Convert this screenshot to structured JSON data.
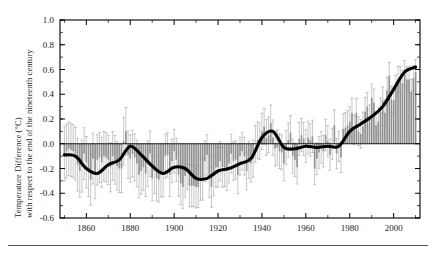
{
  "figure": {
    "name": "global-temperature-anomaly-chart",
    "background_color": "#ffffff",
    "line_color": "#000000",
    "bar_color": "#8c8c8c",
    "errorbar_color": "#9a9a9a",
    "axis_color": "#000000"
  },
  "axes": {
    "ylabel_line1": "Temperature Difference (°C)",
    "ylabel_line2": "with respect to the end of the nineteenth century",
    "xlabel": "",
    "y_ticks": [
      "1.0",
      "0.8",
      "0.6",
      "0.4",
      "0.2",
      "0.0",
      "-0.2",
      "-0.4",
      "-0.6"
    ],
    "x_ticks": [
      "1860",
      "1880",
      "1900",
      "1920",
      "1940",
      "1960",
      "1980",
      "2000"
    ]
  },
  "chart_data": {
    "type": "bar",
    "title": "",
    "xlabel": "",
    "ylabel": "Temperature Difference (°C) with respect to the end of the nineteenth century",
    "xlim": [
      1848,
      2012
    ],
    "ylim": [
      -0.6,
      1.0
    ],
    "ytick_values": [
      1.0,
      0.8,
      0.6,
      0.4,
      0.2,
      0.0,
      -0.2,
      -0.4,
      -0.6
    ],
    "xtick_values": [
      1860,
      1880,
      1900,
      1920,
      1940,
      1960,
      1980,
      2000
    ],
    "minor_xtick_interval": 10,
    "minor_ytick_interval": 0.1,
    "grid": false,
    "legend": null,
    "zero_reference_line": 0.0,
    "series": [
      {
        "name": "Annual temperature anomaly",
        "render": "bars_with_error_bars",
        "x": [
          1850,
          1851,
          1852,
          1853,
          1854,
          1855,
          1856,
          1857,
          1858,
          1859,
          1860,
          1861,
          1862,
          1863,
          1864,
          1865,
          1866,
          1867,
          1868,
          1869,
          1870,
          1871,
          1872,
          1873,
          1874,
          1875,
          1876,
          1877,
          1878,
          1879,
          1880,
          1881,
          1882,
          1883,
          1884,
          1885,
          1886,
          1887,
          1888,
          1889,
          1890,
          1891,
          1892,
          1893,
          1894,
          1895,
          1896,
          1897,
          1898,
          1899,
          1900,
          1901,
          1902,
          1903,
          1904,
          1905,
          1906,
          1907,
          1908,
          1909,
          1910,
          1911,
          1912,
          1913,
          1914,
          1915,
          1916,
          1917,
          1918,
          1919,
          1920,
          1921,
          1922,
          1923,
          1924,
          1925,
          1926,
          1927,
          1928,
          1929,
          1930,
          1931,
          1932,
          1933,
          1934,
          1935,
          1936,
          1937,
          1938,
          1939,
          1940,
          1941,
          1942,
          1943,
          1944,
          1945,
          1946,
          1947,
          1948,
          1949,
          1950,
          1951,
          1952,
          1953,
          1954,
          1955,
          1956,
          1957,
          1958,
          1959,
          1960,
          1961,
          1962,
          1963,
          1964,
          1965,
          1966,
          1967,
          1968,
          1969,
          1970,
          1971,
          1972,
          1973,
          1974,
          1975,
          1976,
          1977,
          1978,
          1979,
          1980,
          1981,
          1982,
          1983,
          1984,
          1985,
          1986,
          1987,
          1988,
          1989,
          1990,
          1991,
          1992,
          1993,
          1994,
          1995,
          1996,
          1997,
          1998,
          1999,
          2000,
          2001,
          2002,
          2003,
          2004,
          2005,
          2006,
          2007,
          2008,
          2009,
          2010
        ],
        "values": [
          -0.08,
          -0.06,
          -0.04,
          -0.05,
          -0.06,
          -0.08,
          -0.17,
          -0.22,
          -0.18,
          -0.08,
          -0.15,
          -0.22,
          -0.29,
          -0.12,
          -0.24,
          -0.13,
          -0.11,
          -0.15,
          -0.1,
          -0.11,
          -0.13,
          -0.19,
          -0.1,
          -0.13,
          -0.18,
          -0.2,
          -0.2,
          0.02,
          0.1,
          -0.09,
          -0.12,
          -0.08,
          -0.11,
          -0.16,
          -0.25,
          -0.22,
          -0.19,
          -0.24,
          -0.16,
          -0.08,
          -0.28,
          -0.22,
          -0.28,
          -0.29,
          -0.25,
          -0.25,
          -0.1,
          -0.09,
          -0.25,
          -0.14,
          -0.06,
          -0.13,
          -0.25,
          -0.32,
          -0.35,
          -0.26,
          -0.2,
          -0.34,
          -0.34,
          -0.34,
          -0.35,
          -0.35,
          -0.29,
          -0.29,
          -0.14,
          -0.09,
          -0.27,
          -0.35,
          -0.26,
          -0.19,
          -0.19,
          -0.14,
          -0.19,
          -0.19,
          -0.22,
          -0.16,
          -0.08,
          -0.14,
          -0.13,
          -0.25,
          -0.1,
          -0.06,
          -0.1,
          -0.22,
          -0.13,
          -0.16,
          -0.12,
          0.0,
          0.03,
          0.02,
          0.1,
          0.14,
          0.05,
          0.07,
          0.17,
          0.05,
          -0.04,
          -0.03,
          -0.06,
          -0.07,
          -0.16,
          -0.03,
          0.03,
          0.09,
          -0.1,
          -0.13,
          -0.19,
          0.04,
          0.07,
          0.04,
          -0.02,
          0.05,
          0.03,
          0.06,
          -0.2,
          -0.12,
          -0.07,
          -0.03,
          -0.06,
          0.07,
          0.02,
          -0.09,
          0.0,
          0.15,
          -0.08,
          -0.02,
          -0.11,
          0.12,
          0.13,
          0.15,
          0.18,
          0.25,
          0.11,
          0.25,
          0.1,
          0.08,
          0.14,
          0.26,
          0.3,
          0.2,
          0.37,
          0.33,
          0.15,
          0.18,
          0.26,
          0.35,
          0.25,
          0.43,
          0.55,
          0.36,
          0.35,
          0.45,
          0.52,
          0.52,
          0.49,
          0.57,
          0.52,
          0.52,
          0.42,
          0.53,
          0.58
        ],
        "error_bar_halfwidth_typical": 0.16,
        "error_bar_halfwidth_early": 0.22,
        "error_bar_halfwidth_late": 0.1
      },
      {
        "name": "Smoothed trend (decadal average)",
        "render": "thick_line",
        "x": [
          1850,
          1855,
          1860,
          1865,
          1870,
          1875,
          1880,
          1885,
          1890,
          1895,
          1900,
          1905,
          1910,
          1915,
          1920,
          1925,
          1930,
          1935,
          1940,
          1945,
          1950,
          1955,
          1960,
          1965,
          1970,
          1975,
          1980,
          1985,
          1990,
          1995,
          2000,
          2005,
          2010
        ],
        "values": [
          -0.09,
          -0.1,
          -0.2,
          -0.24,
          -0.17,
          -0.13,
          -0.02,
          -0.09,
          -0.18,
          -0.24,
          -0.19,
          -0.2,
          -0.28,
          -0.28,
          -0.22,
          -0.2,
          -0.16,
          -0.12,
          0.05,
          0.1,
          -0.03,
          -0.04,
          -0.02,
          -0.03,
          -0.02,
          -0.02,
          0.1,
          0.16,
          0.22,
          0.3,
          0.44,
          0.58,
          0.62
        ]
      }
    ]
  }
}
